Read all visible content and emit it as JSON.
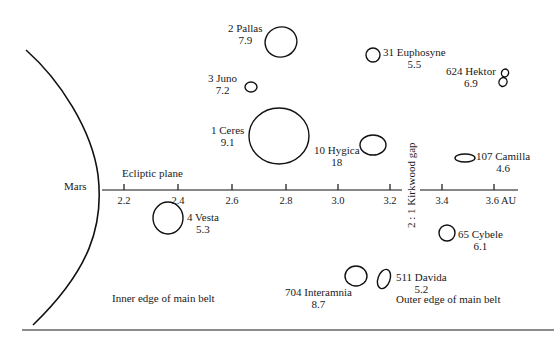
{
  "labels": {
    "planet": "Mars",
    "axis_title": "Ecliptic plane",
    "axis_unit": "AU",
    "gap": "2 : 1 Kirkwood gap",
    "inner_edge": "Inner edge of main belt",
    "outer_edge": "Outer edge of main belt"
  },
  "axis": {
    "ticks": [
      "2.2",
      "2.4",
      "2.6",
      "2.8",
      "3.0",
      "3.2",
      "3.4",
      "3.6 AU"
    ]
  },
  "asteroids": [
    {
      "name": "2 Pallas",
      "value": "7.9"
    },
    {
      "name": "3 Juno",
      "value": "7.2"
    },
    {
      "name": "1 Ceres",
      "value": "9.1"
    },
    {
      "name": "31 Euphosyne",
      "value": "5.5"
    },
    {
      "name": "624 Hektor",
      "value": "6.9"
    },
    {
      "name": "10 Hygica",
      "value": "18"
    },
    {
      "name": "107 Camilla",
      "value": "4.6"
    },
    {
      "name": "4 Vesta",
      "value": "5.3"
    },
    {
      "name": "65 Cybele",
      "value": "6.1"
    },
    {
      "name": "704 Interamnia",
      "value": "8.7"
    },
    {
      "name": "511 Davida",
      "value": "5.2"
    }
  ]
}
